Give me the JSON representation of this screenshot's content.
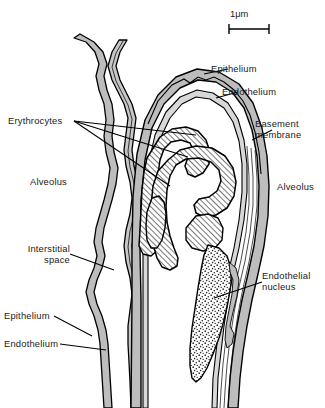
{
  "figure": {
    "name": "alveolar-capillary-ultrastructure",
    "scale_bar": {
      "label": "1μm",
      "icon": "scale-bar-icon"
    },
    "labels": {
      "epithelium_top": "Epithelium",
      "endothelium_top": "Endothelium",
      "basement_membrane": "Basement\nmembrane",
      "erythrocytes": "Erythrocytes",
      "alveolus_left": "Alveolus",
      "alveolus_right": "Alveolus",
      "interstitial_space": "Interstitial\nspace",
      "endothelial_nucleus": "Endothelial\nnucleus",
      "epithelium_bottom": "Epithelium",
      "endothelium_bottom": "Endothelium"
    },
    "colors": {
      "ink": "#000000",
      "text": "#1a1a1a",
      "membrane_gray": "#b9b9b9",
      "membrane_gray_light": "#d2d2d2",
      "lumen_white": "#ffffff",
      "background": "#ffffff"
    },
    "structures": {
      "erythrocyte_fill": "diagonal-hatch",
      "nucleus_fill": "stipple-dots",
      "membrane_fill": "solid-gray"
    }
  }
}
